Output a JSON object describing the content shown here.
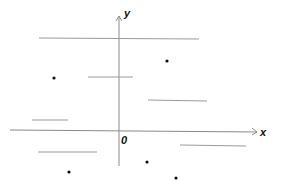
{
  "diagram": {
    "axes": {
      "x_label": "x",
      "y_label": "y",
      "origin_label": "0",
      "color": "#8a8a8a"
    },
    "segments": [
      {
        "x1": 39,
        "y1": 38,
        "x2": 199,
        "y2": 39
      },
      {
        "x1": 88,
        "y1": 77,
        "x2": 133,
        "y2": 77
      },
      {
        "x1": 148,
        "y1": 100,
        "x2": 207,
        "y2": 101
      },
      {
        "x1": 32,
        "y1": 120,
        "x2": 68,
        "y2": 120
      },
      {
        "x1": 180,
        "y1": 145,
        "x2": 246,
        "y2": 146
      },
      {
        "x1": 38,
        "y1": 152,
        "x2": 97,
        "y2": 152
      }
    ],
    "points": [
      {
        "x": 167,
        "y": 61
      },
      {
        "x": 54,
        "y": 78
      },
      {
        "x": 147,
        "y": 162
      },
      {
        "x": 69,
        "y": 172
      },
      {
        "x": 176,
        "y": 178
      }
    ],
    "segment_color": "#9a9a9a",
    "point_color": "#111111"
  }
}
